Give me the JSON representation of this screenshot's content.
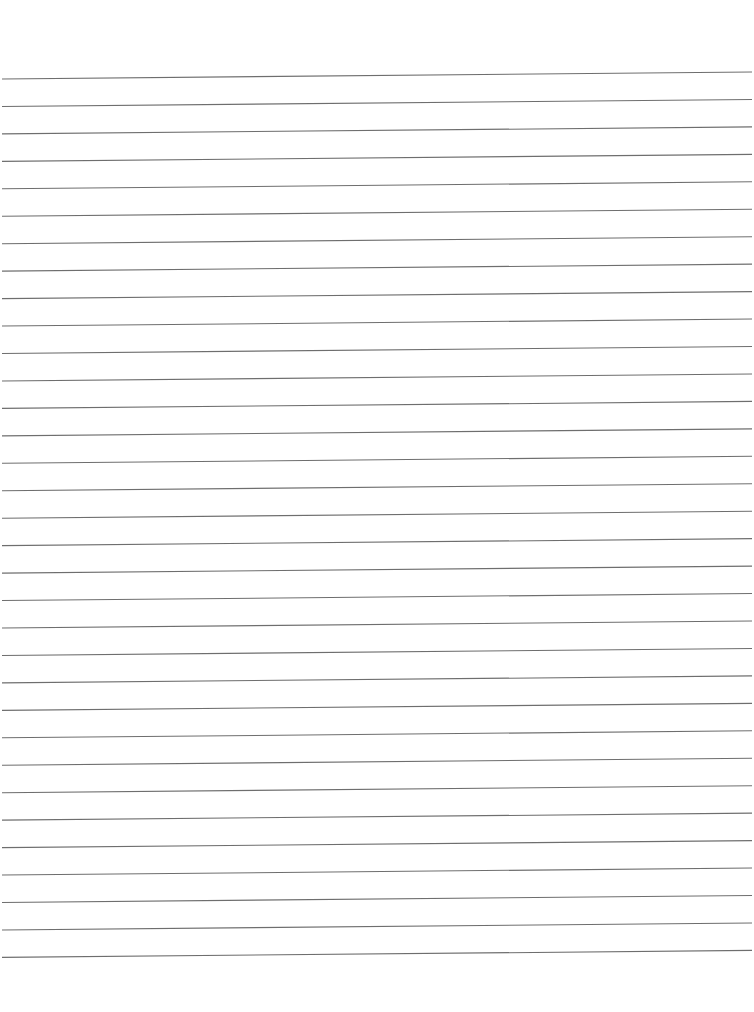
{
  "document": {
    "type": "lined-paper",
    "line_count": 33,
    "first_line_y_left": 79,
    "line_spacing": 27.45,
    "slope_drop_right": -7,
    "line_color": "#6e6e6e",
    "background": "#ffffff",
    "text": []
  }
}
